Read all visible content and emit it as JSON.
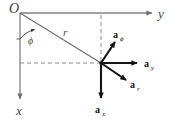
{
  "figure": {
    "kind": "vector-diagram",
    "background_color": "#ffffff",
    "axis_color": "#808080",
    "vector_color": "#141414",
    "dash_color": "#8a8a8a",
    "origin_label": "O",
    "axes": [
      {
        "name": "y-axis",
        "label": "y",
        "direction": "right"
      },
      {
        "name": "x-axis",
        "label": "x",
        "direction": "down"
      }
    ],
    "radial_line": {
      "name": "r-line",
      "label": "r"
    },
    "angle": {
      "name": "phi-angle",
      "label": "ϕ"
    },
    "dashed_lines": [
      {
        "name": "horizontal-dashed-line"
      },
      {
        "name": "vertical-dashed-line"
      }
    ],
    "vectors": [
      {
        "name": "a-phi-vector",
        "base": "a",
        "subscript": "ϕ"
      },
      {
        "name": "a-y-vector",
        "base": "a",
        "subscript": "y"
      },
      {
        "name": "a-r-vector",
        "base": "a",
        "subscript": "r"
      },
      {
        "name": "a-x-vector",
        "base": "a",
        "subscript": "x"
      }
    ]
  }
}
